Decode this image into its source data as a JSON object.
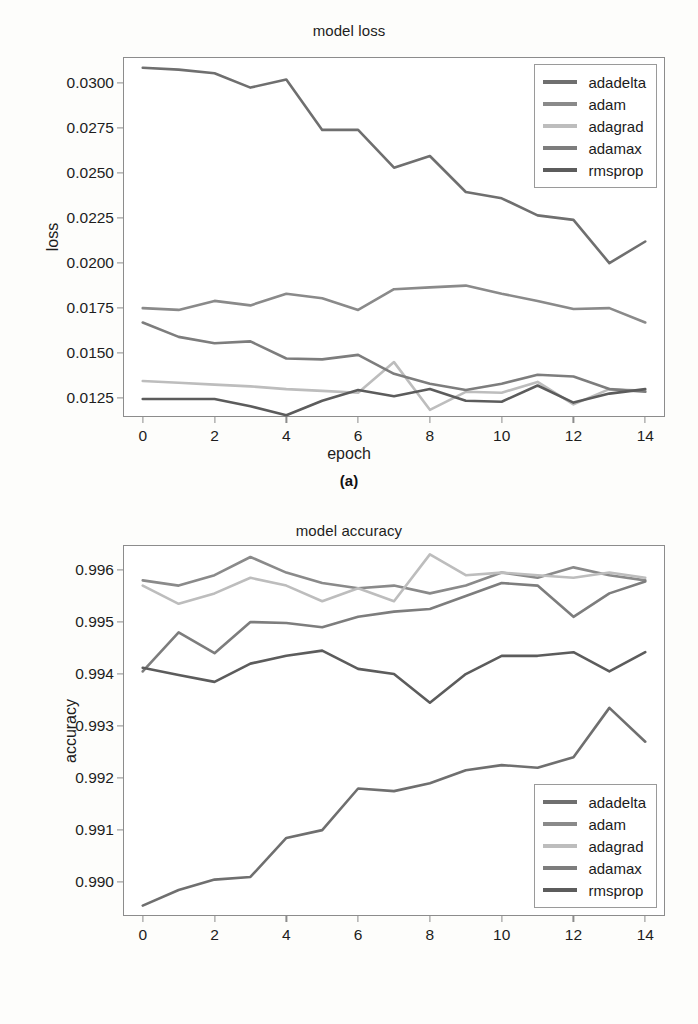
{
  "figure": {
    "panels": [
      {
        "key": "a",
        "caption_prefix": "(",
        "caption_letter": "a",
        "caption_suffix": ")",
        "caption": "(a)"
      },
      {
        "key": "b",
        "caption_prefix": "(",
        "caption_letter": "b",
        "caption_suffix": ")",
        "caption": "(b)"
      }
    ]
  },
  "colors": {
    "adadelta": "#6f6f6f",
    "adam": "#8a8a8a",
    "adagrad": "#bdbdbd",
    "adamax": "#7d7d7d",
    "rmsprop": "#5c5c5c",
    "axis": "#8c8c8c",
    "text": "#1d1d1d",
    "background": "#fdfdfb",
    "plot_background": "#ffffff"
  },
  "chart_data": [
    {
      "type": "line",
      "panel": "a",
      "title": "model loss",
      "xlabel": "epoch",
      "ylabel": "loss",
      "caption": "(a)",
      "x": [
        0,
        1,
        2,
        3,
        4,
        5,
        6,
        7,
        8,
        9,
        10,
        11,
        12,
        13,
        14
      ],
      "xlim": [
        -0.55,
        14.55
      ],
      "ylim": [
        0.01145,
        0.03145
      ],
      "xticks": [
        0,
        2,
        4,
        6,
        8,
        10,
        12,
        14
      ],
      "xtick_labels": [
        "0",
        "2",
        "4",
        "6",
        "8",
        "10",
        "12",
        "14"
      ],
      "yticks": [
        0.0125,
        0.015,
        0.0175,
        0.02,
        0.0225,
        0.025,
        0.0275,
        0.03
      ],
      "ytick_labels": [
        "0.0125",
        "0.0150",
        "0.0175",
        "0.0200",
        "0.0225",
        "0.0250",
        "0.0275",
        "0.0300"
      ],
      "grid": false,
      "legend_position": "upper right",
      "series": [
        {
          "name": "adadelta",
          "color": "#6f6f6f",
          "values": [
            0.03085,
            0.03075,
            0.03055,
            0.02975,
            0.0302,
            0.0274,
            0.0274,
            0.0253,
            0.02595,
            0.02395,
            0.0236,
            0.02265,
            0.0224,
            0.02,
            0.0212
          ]
        },
        {
          "name": "adam",
          "color": "#8a8a8a",
          "values": [
            0.0175,
            0.0174,
            0.0179,
            0.01765,
            0.0183,
            0.01805,
            0.0174,
            0.01855,
            0.01865,
            0.01875,
            0.0183,
            0.0179,
            0.01745,
            0.0175,
            0.0167
          ]
        },
        {
          "name": "adagrad",
          "color": "#bdbdbd",
          "values": [
            0.01345,
            0.01335,
            0.01325,
            0.01315,
            0.013,
            0.0129,
            0.0128,
            0.0145,
            0.01185,
            0.01285,
            0.0128,
            0.0134,
            0.01215,
            0.013,
            0.0129
          ]
        },
        {
          "name": "adamax",
          "color": "#7d7d7d",
          "values": [
            0.0167,
            0.0159,
            0.01555,
            0.01565,
            0.0147,
            0.01465,
            0.0149,
            0.01385,
            0.0133,
            0.01295,
            0.0133,
            0.0138,
            0.0137,
            0.013,
            0.01285
          ]
        },
        {
          "name": "rmsprop",
          "color": "#5c5c5c",
          "values": [
            0.01245,
            0.01245,
            0.01245,
            0.01205,
            0.01155,
            0.01235,
            0.01295,
            0.0126,
            0.013,
            0.01235,
            0.0123,
            0.0132,
            0.01225,
            0.01275,
            0.013
          ]
        }
      ]
    },
    {
      "type": "line",
      "panel": "b",
      "title": "model accuracy",
      "xlabel": "epoch",
      "ylabel": "accuracy",
      "caption": "(b)",
      "x": [
        0,
        1,
        2,
        3,
        4,
        5,
        6,
        7,
        8,
        9,
        10,
        11,
        12,
        13,
        14
      ],
      "xlim": [
        -0.55,
        14.55
      ],
      "ylim": [
        0.98935,
        0.99648
      ],
      "xticks": [
        0,
        2,
        4,
        6,
        8,
        10,
        12,
        14
      ],
      "xtick_labels": [
        "0",
        "2",
        "4",
        "6",
        "8",
        "10",
        "12",
        "14"
      ],
      "yticks": [
        0.99,
        0.991,
        0.992,
        0.993,
        0.994,
        0.995,
        0.996
      ],
      "ytick_labels": [
        "0.990",
        "0.991",
        "0.992",
        "0.993",
        "0.994",
        "0.995",
        "0.996"
      ],
      "grid": false,
      "legend_position": "lower right",
      "series": [
        {
          "name": "adadelta",
          "color": "#6f6f6f",
          "values": [
            0.98955,
            0.98985,
            0.99005,
            0.9901,
            0.99085,
            0.991,
            0.9918,
            0.99175,
            0.9919,
            0.99215,
            0.99225,
            0.9922,
            0.9924,
            0.99335,
            0.9927
          ]
        },
        {
          "name": "adam",
          "color": "#8a8a8a",
          "values": [
            0.9958,
            0.9957,
            0.9959,
            0.99625,
            0.99595,
            0.99575,
            0.99565,
            0.9957,
            0.99555,
            0.9957,
            0.99595,
            0.99585,
            0.99605,
            0.9959,
            0.9958
          ]
        },
        {
          "name": "adagrad",
          "color": "#bdbdbd",
          "values": [
            0.9957,
            0.99535,
            0.99555,
            0.99585,
            0.9957,
            0.9954,
            0.99565,
            0.9954,
            0.9963,
            0.9959,
            0.99595,
            0.9959,
            0.99585,
            0.99595,
            0.99585
          ]
        },
        {
          "name": "adamax",
          "color": "#7d7d7d",
          "values": [
            0.99405,
            0.9948,
            0.9944,
            0.995,
            0.99498,
            0.9949,
            0.9951,
            0.9952,
            0.99525,
            0.9955,
            0.99575,
            0.9957,
            0.9951,
            0.99555,
            0.99578
          ]
        },
        {
          "name": "rmsprop",
          "color": "#5c5c5c",
          "values": [
            0.99412,
            0.99398,
            0.99385,
            0.9942,
            0.99435,
            0.99445,
            0.9941,
            0.994,
            0.99345,
            0.994,
            0.99435,
            0.99435,
            0.99442,
            0.99405,
            0.99442
          ]
        }
      ]
    }
  ]
}
